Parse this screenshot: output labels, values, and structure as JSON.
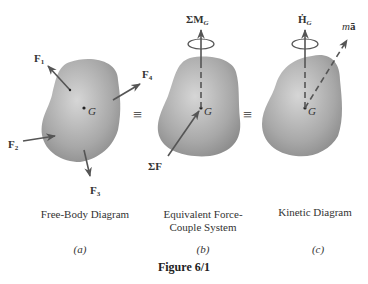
{
  "figure": {
    "title": "Figure 6/1",
    "panels": [
      {
        "id": "a",
        "caption": "Free-Body Diagram",
        "sub_label": "(a)",
        "labels": {
          "center": "G",
          "forces": [
            "F1",
            "F2",
            "F3",
            "F4"
          ]
        }
      },
      {
        "id": "b",
        "caption_line1": "Equivalent Force-",
        "caption_line2": "Couple System",
        "sub_label": "(b)",
        "labels": {
          "center": "G",
          "moment": "ΣM_G",
          "force": "ΣF"
        }
      },
      {
        "id": "c",
        "caption": "Kinetic Diagram",
        "sub_label": "(c)",
        "labels": {
          "center": "G",
          "moment": "Ḣ_G",
          "force": "ma̅"
        }
      }
    ],
    "equivalence_symbol": "≡",
    "colors": {
      "body": "#9a9a9a",
      "body_light": "#cfcfcf",
      "arrow": "#555555",
      "text": "#333333"
    }
  }
}
